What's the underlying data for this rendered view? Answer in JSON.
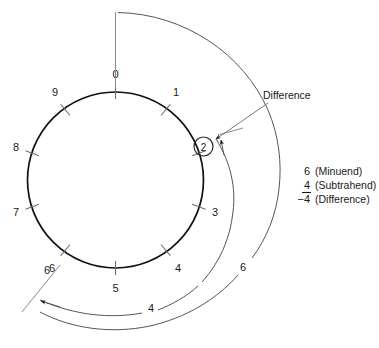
{
  "figure": {
    "dial": {
      "name": "decimal-counting-dial",
      "digits": [
        "0",
        "1",
        "3",
        "4",
        "5",
        "6",
        "7",
        "8",
        "9"
      ],
      "tick_count": 10,
      "missing_digit_label_at": "2"
    },
    "result_marker": {
      "value": "2",
      "callout": "Difference"
    },
    "sweeps": [
      {
        "name": "subtrahend-sweep",
        "label": "4"
      },
      {
        "name": "minuend-sweep",
        "label": "6"
      },
      {
        "name": "start-tick-label",
        "label": "6"
      }
    ],
    "equation": {
      "minuend": {
        "value": "6",
        "word": "(Minuend)"
      },
      "subtrahend": {
        "value": "4",
        "word": "(Subtrahend)"
      },
      "difference": {
        "value": "−4",
        "word": "(Difference)"
      }
    },
    "colors": {
      "ink": "#1a1a1a",
      "dial_stroke": "#111111",
      "arc_stroke": "#555555",
      "tick_stroke": "#6f6f6f",
      "background": "#ffffff"
    }
  }
}
